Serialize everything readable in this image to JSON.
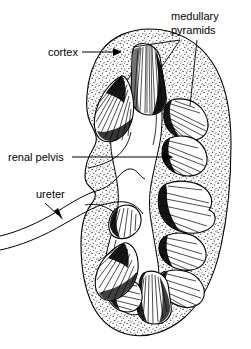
{
  "figure": {
    "name": "kidney-coronal-section",
    "background_color": "#ffffff",
    "ink_color": "#000000",
    "width": 251,
    "height": 349
  },
  "labels": {
    "medullary_pyramids_line1": "medullary",
    "medullary_pyramids_line2": "pyramids",
    "cortex": "cortex",
    "renal_pelvis": "renal pelvis",
    "ureter": "ureter"
  },
  "annotations": [
    {
      "id": "medullary-pyramids",
      "text": "medullary pyramids",
      "text_x": 171,
      "text_y": 20,
      "leader_type": "plain-line",
      "leaders": 2
    },
    {
      "id": "cortex",
      "text": "cortex",
      "text_x": 48,
      "text_y": 56,
      "leader_type": "arrow",
      "leaders": 1
    },
    {
      "id": "renal-pelvis",
      "text": "renal pelvis",
      "text_x": 8,
      "text_y": 161,
      "leader_type": "arrow",
      "leaders": 1
    },
    {
      "id": "ureter",
      "text": "ureter",
      "text_x": 36,
      "text_y": 198,
      "leader_type": "arrow",
      "leaders": 1
    }
  ],
  "structures": {
    "cortex_region": "stippled outer zone of kidney",
    "pyramid_count": 11,
    "renal_pelvis_region": "central unshaded funnel cavity",
    "ureter_region": "twin-line tube exiting left"
  }
}
